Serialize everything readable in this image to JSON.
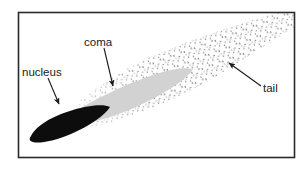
{
  "figure": {
    "background_color": "#ffffff",
    "frame": {
      "name": "diagram border",
      "color": "#2b2b2b",
      "x": 18,
      "y": 12,
      "width": 277,
      "height": 146
    }
  },
  "labels": {
    "nucleus": "nucleus",
    "coma": "coma",
    "tail": "tail"
  },
  "parts": {
    "nucleus": {
      "label": "nucleus",
      "fill": "#0d0d0d",
      "description": "solid black elongated core at lower left of the comet"
    },
    "coma": {
      "label": "coma",
      "fill": "#d2d2d2",
      "description": "light grey lens shaped envelope surrounding the nucleus"
    },
    "tail": {
      "label": "tail",
      "fill": "#4a4a4a",
      "description": "stippled dot field fanning out toward the upper right"
    }
  },
  "leaders": {
    "nucleus_arrow": {
      "name": "nucleus leader arrow",
      "from_x": 48,
      "from_y": 78,
      "to_x": 59,
      "to_y": 106
    },
    "coma_arrow": {
      "name": "coma leader arrow",
      "from_x": 104,
      "from_y": 48,
      "to_x": 113,
      "to_y": 89
    },
    "tail_arrow": {
      "name": "tail leader arrow",
      "from_x": 261,
      "from_y": 86,
      "to_x": 227,
      "to_y": 61
    }
  },
  "label_positions": {
    "nucleus": {
      "x": 22,
      "y": 76
    },
    "coma": {
      "x": 84,
      "y": 46
    },
    "tail": {
      "x": 263,
      "y": 92
    }
  }
}
